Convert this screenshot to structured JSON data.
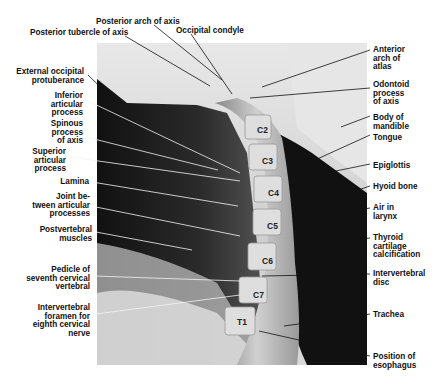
{
  "figure": {
    "left_labels": [
      {
        "id": "posterior-arch-of-axis",
        "text": "Posterior arch of axis",
        "x": 96,
        "y": 18
      },
      {
        "id": "posterior-tubercle-of-axis",
        "text": "Posterior tubercle of axis",
        "x": 30,
        "y": 29
      },
      {
        "id": "external-occipital-protuberance",
        "text": "External occipital\nprotuberance",
        "x": 5,
        "y": 68
      },
      {
        "id": "inferior-articular-process",
        "text": "Inferior\narticular\nprocess",
        "x": 30,
        "y": 93
      },
      {
        "id": "spinous-process-of-axis",
        "text": "Spinous\nprocess\nof axis",
        "x": 30,
        "y": 121
      },
      {
        "id": "superior-articular-process",
        "text": "Superior\narticular\nprocess",
        "x": 20,
        "y": 149
      },
      {
        "id": "lamina",
        "text": "Lamina",
        "x": 40,
        "y": 178
      },
      {
        "id": "joint-between-articular-processes",
        "text": "Joint be-\ntween articular\nprocesses",
        "x": 20,
        "y": 193
      },
      {
        "id": "postvertebral-muscles",
        "text": "Postvertebral\nmuscles",
        "x": 30,
        "y": 226
      },
      {
        "id": "pedicle-of-seventh-cervical-vertebral",
        "text": "Pedicle of\nseventh cervical\nvertebral",
        "x": 20,
        "y": 266
      },
      {
        "id": "intervertebral-foramen-eighth-cervical-nerve",
        "text": "Intervertebral\nforamen for\neighth cervical\nnerve",
        "x": 20,
        "y": 304
      }
    ],
    "top_labels": [
      {
        "id": "occipital-condyle",
        "text": "Occipital condyle",
        "x": 176,
        "y": 27
      }
    ],
    "right_labels": [
      {
        "id": "anterior-arch-of-atlas",
        "text": "Anterior\narch of\natlas",
        "x": 373,
        "y": 46
      },
      {
        "id": "odontoid-process-of-axis",
        "text": "Odontoid\nprocess\nof axis",
        "x": 373,
        "y": 81
      },
      {
        "id": "body-of-mandible",
        "text": "Body of\nmandible",
        "x": 373,
        "y": 114
      },
      {
        "id": "tongue",
        "text": "Tongue",
        "x": 373,
        "y": 134
      },
      {
        "id": "epiglottis",
        "text": "Epiglottis",
        "x": 373,
        "y": 162
      },
      {
        "id": "hyoid-bone",
        "text": "Hyoid bone",
        "x": 373,
        "y": 183
      },
      {
        "id": "air-in-larynx",
        "text": "Air in\nlarynx",
        "x": 373,
        "y": 204
      },
      {
        "id": "thyroid-cartilage-calcification",
        "text": "Thyroid\ncartilage\ncalcification",
        "x": 373,
        "y": 234
      },
      {
        "id": "intervertebral-disc",
        "text": "Intervertebral\ndisc",
        "x": 373,
        "y": 270
      },
      {
        "id": "trachea",
        "text": "Trachea",
        "x": 373,
        "y": 311
      },
      {
        "id": "position-of-esophagus",
        "text": "Position of\nesophagus",
        "x": 373,
        "y": 353
      }
    ],
    "vertebra_labels": [
      {
        "text": "C2",
        "x": 257,
        "y": 125
      },
      {
        "text": "C3",
        "x": 262,
        "y": 156
      },
      {
        "text": "C4",
        "x": 268,
        "y": 188
      },
      {
        "text": "C5",
        "x": 267,
        "y": 221
      },
      {
        "text": "C6",
        "x": 262,
        "y": 256
      },
      {
        "text": "C7",
        "x": 253,
        "y": 290
      },
      {
        "text": "T1",
        "x": 237,
        "y": 317
      }
    ]
  }
}
